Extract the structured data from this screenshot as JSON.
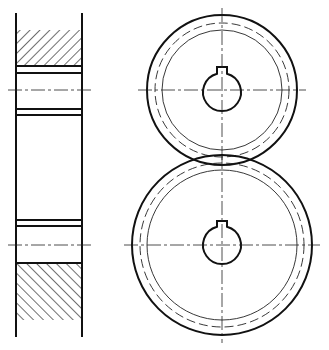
{
  "drawing": {
    "title": "",
    "type": "spur gear pair assembly drawing",
    "colors": {
      "line": "#111111",
      "background": "#ffffff"
    },
    "side_view": {
      "left_x": 16,
      "right_x": 82,
      "top_y": 15,
      "bottom_y": 335,
      "upper_hatch": {
        "y1": 30,
        "y2": 66,
        "direction": "/"
      },
      "lower_hatch": {
        "y1": 263,
        "y2": 320,
        "direction": "\\"
      },
      "horizontal_lines_y": [
        66,
        73,
        109,
        115,
        220,
        226,
        263
      ],
      "centerlines_y": [
        90,
        245
      ]
    },
    "upper_gear": {
      "cx": 222,
      "cy": 90,
      "outer_radius": 75,
      "pitch_radius": 67,
      "root_radius": 60,
      "bore_radius": 19,
      "keyway": {
        "width": 10,
        "top_y": 66
      }
    },
    "lower_gear": {
      "cx": 222,
      "cy": 245,
      "outer_radius": 90,
      "pitch_radius": 82,
      "root_radius": 75,
      "bore_radius": 19,
      "keyway": {
        "width": 10,
        "top_y": 221
      }
    }
  }
}
